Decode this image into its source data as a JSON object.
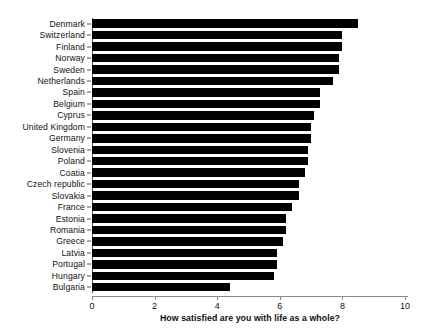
{
  "chart_data": {
    "type": "bar",
    "orientation": "horizontal",
    "title": "",
    "subtitle": "",
    "xlabel": "How satisfied are you with life as a whole?",
    "ylabel": "",
    "xlim": [
      0,
      10
    ],
    "xticks": [
      0,
      2,
      4,
      6,
      8,
      10
    ],
    "xtick_labels": [
      "0",
      "2",
      "4",
      "6",
      "8",
      "10"
    ],
    "grid": false,
    "legend": false,
    "bar_color": "#000000",
    "categories": [
      "Denmark",
      "Switzerland",
      "Finland",
      "Norway",
      "Sweden",
      "Netherlands",
      "Spain",
      "Belgium",
      "Cyprus",
      "United Kingdom",
      "Germany",
      "Slovenia",
      "Poland",
      "Coatia",
      "Czech republic",
      "Slovakia",
      "France",
      "Estonia",
      "Romania",
      "Greece",
      "Latvia",
      "Portugal",
      "Hungary",
      "Bulgaria"
    ],
    "values": [
      8.5,
      8.0,
      8.0,
      7.9,
      7.9,
      7.7,
      7.3,
      7.3,
      7.1,
      7.0,
      7.0,
      6.9,
      6.9,
      6.8,
      6.6,
      6.6,
      6.4,
      6.2,
      6.2,
      6.1,
      5.9,
      5.9,
      5.8,
      4.4
    ]
  },
  "axis": {
    "x_title": "How satisfied are you with life as a whole?"
  }
}
